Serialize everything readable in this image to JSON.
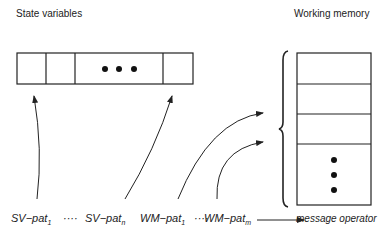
{
  "headings": {
    "state_variables": "State variables",
    "working_memory": "Working memory"
  },
  "state_vector": {
    "cells": 4,
    "ellipsis": "• • •"
  },
  "working_memory_stack": {
    "rows": 3,
    "ellipsis": "vertical dots"
  },
  "patterns": [
    {
      "base": "SV−pat",
      "sub": "1"
    },
    {
      "sep": "····"
    },
    {
      "base": "SV−pat",
      "sub": "n"
    },
    {
      "base": "WM−pat",
      "sub": "1"
    },
    {
      "sep": "····"
    },
    {
      "base": "WM−pat",
      "sub": "m"
    }
  ],
  "labels": {
    "p0": "SV−pat",
    "p0s": "1",
    "sep1": "····",
    "p1": "SV−pat",
    "p1s": "n",
    "p2": "WM−pat",
    "p2s": "1",
    "sep2": "····",
    "p3": "WM−pat",
    "p3s": "m",
    "target": "message operator"
  }
}
